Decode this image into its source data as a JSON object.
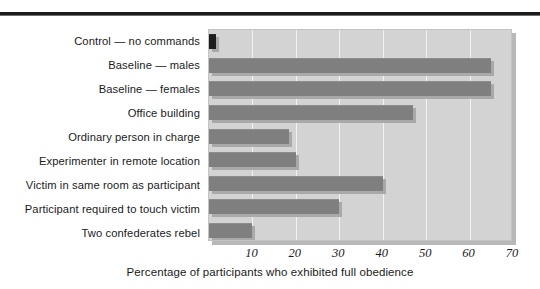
{
  "chart_data": {
    "type": "bar",
    "orientation": "horizontal",
    "title": "",
    "xlabel": "Percentage of participants who exhibited full obedience",
    "ylabel": "",
    "xlim": [
      0,
      70
    ],
    "xticks": [
      10,
      20,
      30,
      40,
      50,
      60,
      70
    ],
    "grid": true,
    "legend": false,
    "categories": [
      "Control — no commands",
      "Baseline — males",
      "Baseline — females",
      "Office building",
      "Ordinary person in charge",
      "Experimenter in remote location",
      "Victim in same room as participant",
      "Participant required to touch victim",
      "Two confederates rebel"
    ],
    "values": [
      1.5,
      65,
      65,
      47,
      18.5,
      20,
      40,
      30,
      10
    ],
    "colors": {
      "bar": "#7f7f7f",
      "bar_control": "#1d1d1d",
      "bar_shadow": "#a9a9a9",
      "plot_background": "#d3d3d3",
      "gridline": "#f2f2f2",
      "page_background": "#ffffff",
      "rule": "#1b1b1b",
      "text": "#1a1a1a"
    }
  }
}
